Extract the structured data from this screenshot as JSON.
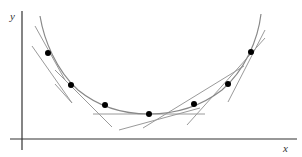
{
  "diagram": {
    "axes": {
      "x_label": "x",
      "y_label": "y",
      "color": "#333333"
    },
    "curve": {
      "color": "#888888",
      "path": "M 40 16 C 44 40, 56 70, 78 90 C 100 108, 125 114, 149 114 C 174 114, 200 107, 222 90 C 245 70, 258 40, 261 14"
    },
    "points": [
      {
        "x": 48,
        "y": 53
      },
      {
        "x": 71,
        "y": 85
      },
      {
        "x": 105,
        "y": 105
      },
      {
        "x": 149,
        "y": 114
      },
      {
        "x": 194,
        "y": 104
      },
      {
        "x": 228,
        "y": 84
      },
      {
        "x": 251,
        "y": 52
      }
    ],
    "point_color": "#000000",
    "tangent_color": "#9a9a9a",
    "tangents": [
      {
        "x1": 35,
        "y1": 26,
        "x2": 65,
        "y2": 80
      },
      {
        "x1": 32,
        "y1": 46,
        "x2": 72,
        "y2": 103
      },
      {
        "x1": 55,
        "y1": 84,
        "x2": 72,
        "y2": 103
      },
      {
        "x1": 55,
        "y1": 70,
        "x2": 112,
        "y2": 127
      },
      {
        "x1": 93,
        "y1": 114,
        "x2": 205,
        "y2": 114
      },
      {
        "x1": 143,
        "y1": 128,
        "x2": 244,
        "y2": 66
      },
      {
        "x1": 187,
        "y1": 125,
        "x2": 265,
        "y2": 38
      },
      {
        "x1": 228,
        "y1": 102,
        "x2": 265,
        "y2": 30
      },
      {
        "x1": 119,
        "y1": 130,
        "x2": 200,
        "y2": 108
      }
    ]
  }
}
